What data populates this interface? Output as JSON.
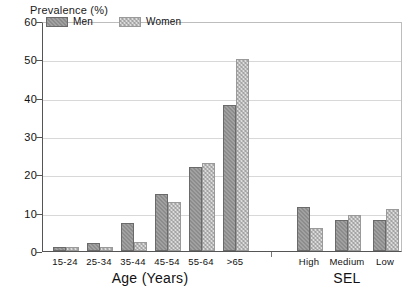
{
  "chart_data": {
    "type": "bar",
    "title": "",
    "ylabel": "Prevalence (%)",
    "xlabel": "",
    "ylim": [
      0,
      60
    ],
    "yticks": [
      0,
      10,
      20,
      30,
      40,
      50,
      60
    ],
    "grid": true,
    "legend_position": "top-left",
    "legend": [
      "Men",
      "Women"
    ],
    "groups": [
      {
        "group_label": "Age (Years)",
        "categories": [
          "15-24",
          "25-34",
          "35-44",
          "45-54",
          "55-64",
          ">65"
        ],
        "series": [
          {
            "name": "Men",
            "values": [
              1,
              2.2,
              7.2,
              15,
              21.8,
              38
            ]
          },
          {
            "name": "Women",
            "values": [
              1,
              1,
              2.4,
              12.8,
              23,
              50
            ]
          }
        ]
      },
      {
        "group_label": "SEL",
        "categories": [
          "High",
          "Medium",
          "Low"
        ],
        "series": [
          {
            "name": "Men",
            "values": [
              11.5,
              8,
              8
            ]
          },
          {
            "name": "Women",
            "values": [
              6,
              9.5,
              11
            ]
          }
        ]
      }
    ],
    "colors": {
      "men": "#8c8c8c",
      "women": "#dcdcdc",
      "grid": "#d8d8d8",
      "axis": "#555555",
      "text": "#111111",
      "background": "#ffffff"
    }
  }
}
